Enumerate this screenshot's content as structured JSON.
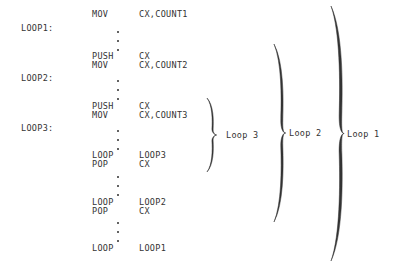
{
  "labels": [
    {
      "text": "LOOP1:",
      "y": 28
    },
    {
      "text": "LOOP2:",
      "y": 78
    },
    {
      "text": "LOOP3:",
      "y": 128
    }
  ],
  "instructions": [
    {
      "op": "MOV",
      "arg": "CX,COUNT1",
      "y": 14
    },
    {
      "op": "PUSH",
      "arg": "CX",
      "y": 56
    },
    {
      "op": "MOV",
      "arg": "CX,COUNT2",
      "y": 65
    },
    {
      "op": "PUSH",
      "arg": "CX",
      "y": 106
    },
    {
      "op": "MOV",
      "arg": "CX,COUNT3",
      "y": 115
    },
    {
      "op": "LOOP",
      "arg": "LOOP3",
      "y": 155
    },
    {
      "op": "POP",
      "arg": "CX",
      "y": 164
    },
    {
      "op": "LOOP",
      "arg": "LOOP2",
      "y": 202
    },
    {
      "op": "POP",
      "arg": "CX",
      "y": 211
    },
    {
      "op": "LOOP",
      "arg": "LOOP1",
      "y": 248
    }
  ],
  "ellipsis_dots_y": [
    31,
    40,
    49,
    80,
    89,
    98,
    130,
    139,
    148,
    176,
    185,
    194,
    222,
    231,
    240
  ],
  "braces": [
    {
      "label": "Loop 3",
      "top": 98,
      "bottom": 172,
      "x": 207,
      "label_x": 226
    },
    {
      "label": "Loop 2",
      "top": 44,
      "bottom": 222,
      "x": 274,
      "label_x": 289
    },
    {
      "label": "Loop 1",
      "top": 6,
      "bottom": 261,
      "x": 331,
      "label_x": 347
    }
  ],
  "colors": {
    "ink": "#333333",
    "background": "#ffffff"
  }
}
